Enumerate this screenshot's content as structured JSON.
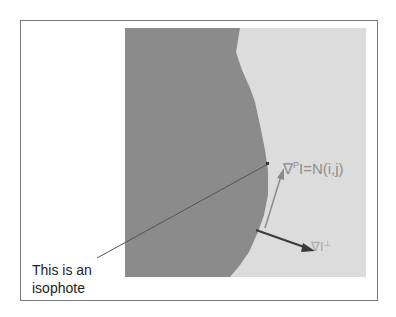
{
  "figure": {
    "colors": {
      "dark_region": "#8b8b8b",
      "light_region": "#dcdcdc",
      "frame_border": "#7a7a7a",
      "gradient_arrow": "#8a8a8a",
      "isophote_arrow": "#3a3a3a",
      "pointer_line": "#555555"
    },
    "callout": {
      "line1": "This is an",
      "line2": "isophote"
    },
    "gradient_label": {
      "nabla": "∇",
      "superscript": "P",
      "rest": "I=N(i,j)"
    },
    "isophote_label": {
      "main": "∇I",
      "superscript": "⊥"
    }
  }
}
